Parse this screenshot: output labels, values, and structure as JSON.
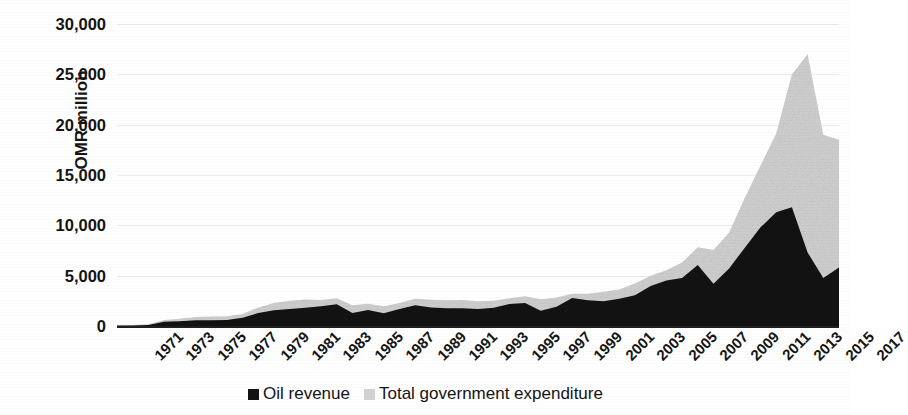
{
  "chart_data": {
    "type": "area",
    "title": "",
    "subtitle": "",
    "xlabel": "",
    "ylabel": "OMR million",
    "ylim": [
      0,
      30000
    ],
    "xlim": [
      1971,
      2017
    ],
    "grid": true,
    "legend_position": "bottom",
    "y_ticks": [
      0,
      5000,
      10000,
      15000,
      20000,
      25000,
      30000
    ],
    "y_tick_labels": [
      "0",
      "5,000",
      "10,000",
      "15,000",
      "20,000",
      "25,000",
      "30,000"
    ],
    "x": [
      1971,
      1972,
      1973,
      1974,
      1975,
      1976,
      1977,
      1978,
      1979,
      1980,
      1981,
      1982,
      1983,
      1984,
      1985,
      1986,
      1987,
      1988,
      1989,
      1990,
      1991,
      1992,
      1993,
      1994,
      1995,
      1996,
      1997,
      1998,
      1999,
      2000,
      2001,
      2002,
      2003,
      2004,
      2005,
      2006,
      2007,
      2008,
      2009,
      2010,
      2011,
      2012,
      2013,
      2014,
      2015,
      2016,
      2017
    ],
    "x_tick_labels": [
      "1971",
      "1973",
      "1975",
      "1977",
      "1979",
      "1981",
      "1983",
      "1985",
      "1987",
      "1989",
      "1991",
      "1993",
      "1995",
      "1997",
      "1999",
      "2001",
      "2003",
      "2005",
      "2007",
      "2009",
      "2011",
      "2013",
      "2015",
      "2017"
    ],
    "series": [
      {
        "name": "Oil revenue",
        "color": "#121212",
        "values": [
          40,
          60,
          110,
          420,
          460,
          560,
          570,
          600,
          820,
          1280,
          1560,
          1700,
          1820,
          1950,
          2150,
          1280,
          1580,
          1270,
          1700,
          2050,
          1850,
          1760,
          1760,
          1700,
          1820,
          2180,
          2280,
          1520,
          1900,
          2790,
          2560,
          2470,
          2700,
          3050,
          3980,
          4520,
          4760,
          6060,
          4190,
          5720,
          7780,
          9800,
          11300,
          11800,
          7300,
          4780,
          5800
        ]
      },
      {
        "name": "Total government expenditure",
        "color": "#d3d3d3",
        "values": [
          60,
          110,
          180,
          600,
          720,
          900,
          940,
          980,
          1180,
          1850,
          2280,
          2500,
          2640,
          2580,
          2750,
          2050,
          2200,
          1950,
          2280,
          2700,
          2600,
          2550,
          2580,
          2450,
          2520,
          2750,
          2960,
          2650,
          2820,
          3200,
          3200,
          3400,
          3630,
          4220,
          5000,
          5540,
          6320,
          7830,
          7560,
          9290,
          12740,
          15940,
          19130,
          25000,
          27000,
          19000,
          18500
        ]
      }
    ],
    "stacking": "overlay"
  },
  "legend": {
    "items": [
      {
        "label": "Oil revenue",
        "color": "#121212",
        "marker": "square-swatch"
      },
      {
        "label": "Total government expenditure",
        "color": "#d3d3d3",
        "marker": "square-swatch"
      }
    ]
  }
}
